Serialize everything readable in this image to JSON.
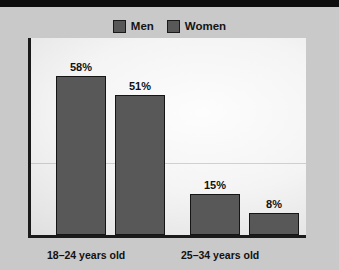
{
  "title_bar": {
    "text": "",
    "clipped": true,
    "background_color": "#0d0d0d",
    "text_color": "#ffffff"
  },
  "colors": {
    "page_background": "#c9c9c9",
    "plot_background_light": "#fdfdfd",
    "plot_background_dark": "#c4c4c4",
    "bar_fill": "#585858",
    "bar_border": "#151515",
    "axis_line": "#1a1a1a",
    "label_text": "#111111",
    "gridline": "rgba(120,120,120,0.30)"
  },
  "legend": {
    "position": "top-center",
    "items": [
      {
        "label": "Men",
        "color": "#585858"
      },
      {
        "label": "Women",
        "color": "#585858"
      }
    ]
  },
  "chart_data": {
    "type": "bar",
    "title": "",
    "xlabel": "",
    "ylabel": "",
    "ylim": [
      0,
      72
    ],
    "grid": true,
    "legend_position": "top-center",
    "categories": [
      "18–24 years old",
      "25–34 years old"
    ],
    "series": [
      {
        "name": "Men",
        "values": [
          58,
          15
        ],
        "labels": [
          "58%",
          "15%"
        ],
        "color": "#585858"
      },
      {
        "name": "Women",
        "values": [
          51,
          8
        ],
        "labels": [
          "51%",
          "8%"
        ],
        "color": "#585858"
      }
    ]
  }
}
